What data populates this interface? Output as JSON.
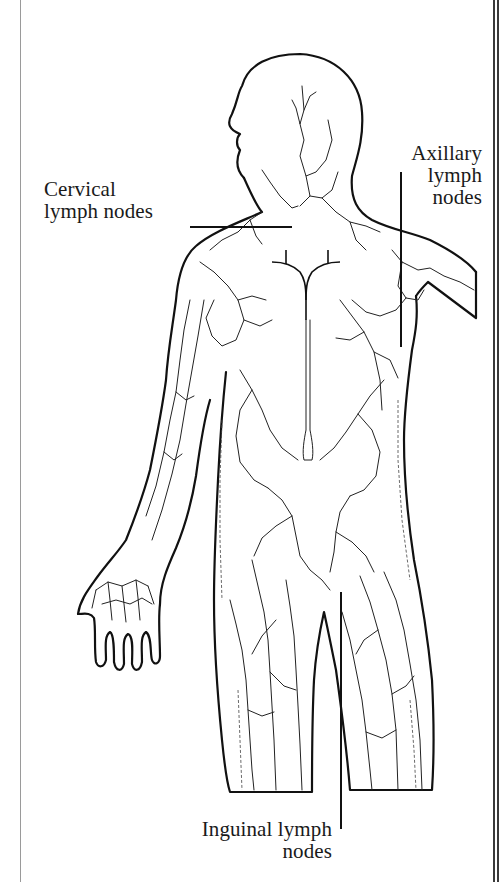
{
  "figure": {
    "labels": {
      "cervical": {
        "line1": "Cervical",
        "line2": "lymph nodes"
      },
      "axillary": {
        "line1": "Axillary",
        "line2": "lymph",
        "line3": "nodes"
      },
      "inguinal": {
        "line1": "Inguinal lymph",
        "line2": "nodes"
      }
    },
    "colors": {
      "ink": "#111111",
      "background": "#ffffff",
      "frame": "#3a3a3a"
    }
  }
}
